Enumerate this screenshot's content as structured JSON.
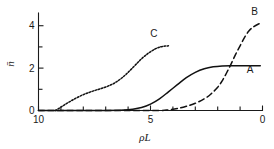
{
  "chart_data": {
    "type": "line",
    "title": "",
    "xlabel": "ρL",
    "ylabel": "n̄",
    "xlim": [
      10,
      0
    ],
    "ylim": [
      0,
      4.6
    ],
    "x_reversed": true,
    "grid": false,
    "legend_position": "inline-curve-labels",
    "x_ticks_major": [
      10,
      5,
      0
    ],
    "x_tick_labels": [
      "10",
      "5",
      "0"
    ],
    "x_ticks_minor": [
      9,
      8,
      7,
      6,
      4,
      3,
      2,
      1
    ],
    "y_ticks_major": [
      0,
      2,
      4
    ],
    "y_tick_labels": [
      "0",
      "2",
      "4"
    ],
    "y_ticks_minor": [
      1,
      3
    ],
    "series": [
      {
        "name": "A",
        "label": "A",
        "linestyle": "solid",
        "label_x": 0.55,
        "label_y": 1.78,
        "x": [
          10.0,
          9.0,
          8.0,
          7.0,
          6.2,
          5.8,
          5.4,
          5.0,
          4.6,
          4.2,
          3.8,
          3.4,
          3.0,
          2.6,
          2.2,
          1.8,
          1.4,
          1.0,
          0.5,
          0.1
        ],
        "y": [
          0.0,
          0.0,
          0.0,
          0.0,
          0.02,
          0.06,
          0.14,
          0.3,
          0.55,
          0.88,
          1.22,
          1.55,
          1.8,
          1.97,
          2.06,
          2.1,
          2.11,
          2.11,
          2.11,
          2.11
        ]
      },
      {
        "name": "B",
        "label": "B",
        "linestyle": "dashed",
        "label_x": 0.35,
        "label_y": 4.52,
        "x": [
          10.0,
          8.0,
          6.0,
          4.6,
          4.2,
          3.8,
          3.4,
          3.0,
          2.6,
          2.3,
          2.0,
          1.8,
          1.6,
          1.4,
          1.2,
          1.0,
          0.8,
          0.6,
          0.4,
          0.2,
          0.05
        ],
        "y": [
          0.0,
          0.0,
          0.0,
          0.0,
          0.03,
          0.09,
          0.2,
          0.34,
          0.55,
          0.78,
          1.1,
          1.4,
          1.78,
          2.2,
          2.65,
          3.05,
          3.45,
          3.76,
          3.95,
          4.07,
          4.12
        ]
      },
      {
        "name": "C",
        "label": "C",
        "linestyle": "dotted",
        "label_x": 4.85,
        "label_y": 3.45,
        "x": [
          9.25,
          9.0,
          8.7,
          8.4,
          8.1,
          7.8,
          7.5,
          7.2,
          6.9,
          6.6,
          6.3,
          6.0,
          5.7,
          5.4,
          5.1,
          4.8,
          4.55,
          4.35,
          4.2
        ],
        "y": [
          0.0,
          0.16,
          0.36,
          0.54,
          0.7,
          0.83,
          0.94,
          1.04,
          1.15,
          1.3,
          1.52,
          1.8,
          2.12,
          2.44,
          2.7,
          2.9,
          3.0,
          3.04,
          3.05
        ]
      }
    ]
  },
  "axes": {
    "y_axis_title": "n̄",
    "x_axis_title": "ρL"
  },
  "colors": {
    "ink": "#111111",
    "background": "#ffffff"
  }
}
